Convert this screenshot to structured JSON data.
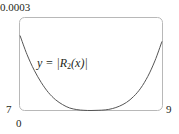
{
  "chart_data": {
    "type": "line",
    "title": "",
    "xlabel": "",
    "ylabel": "",
    "x_ticks": [
      "7",
      "9"
    ],
    "y_ticks": [
      "0",
      "0.0003"
    ],
    "xlim": [
      7,
      9
    ],
    "ylim": [
      0,
      0.0003
    ],
    "grid": false,
    "legend": null,
    "annotations": [
      {
        "text": "y = |R2(x)|",
        "x": 7.35,
        "y": 0.00016
      }
    ],
    "series": [
      {
        "name": "y = |R2(x)|",
        "x": [
          7.0,
          7.1,
          7.2,
          7.3,
          7.4,
          7.5,
          7.6,
          7.7,
          7.8,
          7.9,
          8.0,
          8.1,
          8.2,
          8.3,
          8.4,
          8.5,
          8.6,
          8.7,
          8.8,
          8.9,
          9.0
        ],
        "y": [
          0.000242,
          0.00018,
          0.00013,
          9e-05,
          5.8e-05,
          3.5e-05,
          1.9e-05,
          8e-06,
          3e-06,
          5e-07,
          0.0,
          5e-07,
          2e-06,
          6e-06,
          1.4e-05,
          2.6e-05,
          4.5e-05,
          7.2e-05,
          0.00011,
          0.00016,
          0.000223
        ]
      }
    ]
  },
  "labels": {
    "y_top": "0.0003",
    "y_bottom": "0",
    "x_left": "7",
    "x_right": "9",
    "curve_prefix": "y = |",
    "curve_R": "R",
    "curve_sub": "2",
    "curve_suffix": "(x)|"
  },
  "colors": {
    "frame": "#b8b8b8",
    "curve": "#555555",
    "text": "#231f20"
  }
}
